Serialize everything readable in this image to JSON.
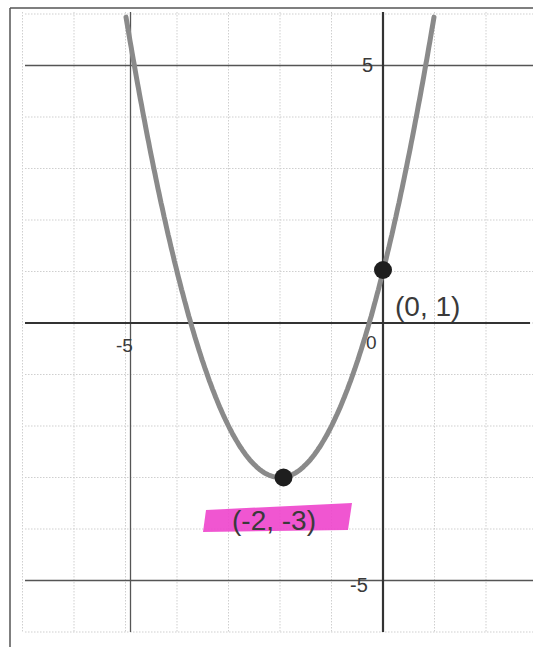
{
  "chart_data": {
    "type": "line",
    "title": "",
    "function": "y = x^2 + 4x + 1",
    "xlabel": "",
    "ylabel": "",
    "xlim": [
      -7,
      3
    ],
    "ylim": [
      -6,
      6
    ],
    "grid": true,
    "grid_step": 1,
    "tick_labels": {
      "x": [
        {
          "value": -5,
          "label": "-5"
        },
        {
          "value": 0,
          "label": "0"
        }
      ],
      "y": [
        {
          "value": 5,
          "label": "5"
        },
        {
          "value": -5,
          "label": "-5"
        }
      ]
    },
    "series": [
      {
        "name": "parabola",
        "x": [
          -5,
          -4.5,
          -4,
          -3.5,
          -3,
          -2.5,
          -2,
          -1.5,
          -1,
          -0.5,
          0,
          0.5,
          0.9
        ],
        "values": [
          6,
          3.25,
          1,
          -0.75,
          -2,
          -2.75,
          -3,
          -2.75,
          -2,
          -0.75,
          1,
          3.25,
          5.41
        ]
      }
    ],
    "points": [
      {
        "x": -2,
        "y": -3,
        "label": "(-2, -3)",
        "highlight": "#ee44cc"
      },
      {
        "x": 0,
        "y": 1,
        "label": "(0, 1)"
      }
    ]
  },
  "labels": {
    "x_neg5": "-5",
    "x_zero": "0",
    "y_pos5": "5",
    "y_neg5": "-5",
    "vertex": "(-2, -3)",
    "intercept": "(0, 1)"
  },
  "colors": {
    "curve": "#8a8a8a",
    "axis": "#444444",
    "grid": "#cfcfcf",
    "point": "#1e1e1e",
    "highlight": "#ee44cc"
  }
}
